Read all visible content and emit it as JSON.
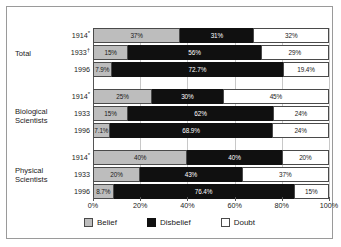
{
  "chart_data": {
    "type": "bar",
    "orientation": "horizontal",
    "stacked": true,
    "title": "",
    "xlabel": "",
    "ylabel": "",
    "xlim": [
      0,
      100
    ],
    "grid": true,
    "legend_position": "bottom",
    "xticks": [
      "0%",
      "20%",
      "40%",
      "60%",
      "80%",
      "100%"
    ],
    "xtick_values": [
      0,
      20,
      40,
      60,
      80,
      100
    ],
    "legend": [
      "Belief",
      "Disbelief",
      "Doubt"
    ],
    "series": [
      {
        "name": "Belief",
        "color": "#bdbdbd",
        "values": [
          37,
          15,
          7.9,
          25,
          15,
          7.1,
          40,
          20,
          8.7
        ]
      },
      {
        "name": "Disbelief",
        "color": "#101010",
        "values": [
          31,
          56,
          72.7,
          30,
          62,
          68.9,
          40,
          43,
          76.4
        ]
      },
      {
        "name": "Doubt",
        "color": "#ffffff",
        "values": [
          32,
          29,
          19.4,
          45,
          24,
          24,
          20,
          37,
          15
        ]
      }
    ],
    "groups": [
      {
        "label": "Total",
        "rows": [
          {
            "year": "1914",
            "marker": "*",
            "belief": "37%",
            "disbelief": "31%",
            "doubt": "32%",
            "belief_v": 37,
            "disbelief_v": 31,
            "doubt_v": 32
          },
          {
            "year": "1933",
            "marker": "†",
            "belief": "15%",
            "disbelief": "56%",
            "doubt": "29%",
            "belief_v": 15,
            "disbelief_v": 56,
            "doubt_v": 29
          },
          {
            "year": "1996",
            "marker": "",
            "belief": "7.9%",
            "disbelief": "72.7%",
            "doubt": "19.4%",
            "belief_v": 7.9,
            "disbelief_v": 72.7,
            "doubt_v": 19.4
          }
        ]
      },
      {
        "label": "Biological Scientists",
        "rows": [
          {
            "year": "1914",
            "marker": "*",
            "belief": "25%",
            "disbelief": "30%",
            "doubt": "45%",
            "belief_v": 25,
            "disbelief_v": 30,
            "doubt_v": 45
          },
          {
            "year": "1933",
            "marker": "",
            "belief": "15%",
            "disbelief": "62%",
            "doubt": "24%",
            "belief_v": 15,
            "disbelief_v": 62,
            "doubt_v": 24
          },
          {
            "year": "1996",
            "marker": "",
            "belief": "7.1%",
            "disbelief": "68.9%",
            "doubt": "24%",
            "belief_v": 7.1,
            "disbelief_v": 68.9,
            "doubt_v": 24
          }
        ]
      },
      {
        "label": "Physical Scientists",
        "rows": [
          {
            "year": "1914",
            "marker": "*",
            "belief": "40%",
            "disbelief": "40%",
            "doubt": "20%",
            "belief_v": 40,
            "disbelief_v": 40,
            "doubt_v": 20
          },
          {
            "year": "1933",
            "marker": "",
            "belief": "20%",
            "disbelief": "43%",
            "doubt": "37%",
            "belief_v": 20,
            "disbelief_v": 43,
            "doubt_v": 37
          },
          {
            "year": "1996",
            "marker": "",
            "belief": "8.7%",
            "disbelief": "76.4%",
            "doubt": "15%",
            "belief_v": 8.7,
            "disbelief_v": 76.4,
            "doubt_v": 15
          }
        ]
      }
    ]
  },
  "group_labels": {
    "total": "Total",
    "biological_line1": "Biological",
    "biological_line2": "Scientists",
    "physical_line1": "Physical",
    "physical_line2": "Scientists"
  },
  "legend": {
    "belief": "Belief",
    "disbelief": "Disbelief",
    "doubt": "Doubt"
  }
}
